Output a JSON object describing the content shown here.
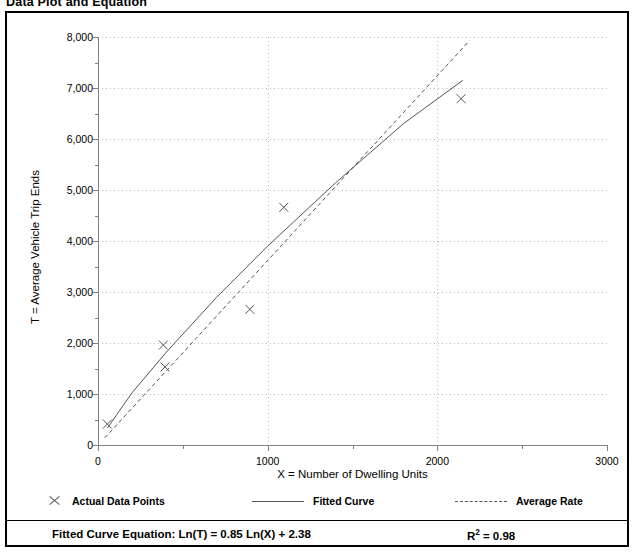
{
  "page": {
    "title": "Data Plot and Equation"
  },
  "legend": {
    "items": [
      {
        "label": "Actual Data Points",
        "marker": "x-marker-icon"
      },
      {
        "label": "Fitted Curve",
        "marker": "solid-line-icon"
      },
      {
        "label": "Average Rate",
        "marker": "dashed-line-icon"
      }
    ]
  },
  "equation": {
    "prefix": "Fitted Curve Equation:",
    "formula": "Ln(T) = 0.85 Ln(X) + 2.38",
    "full": "Fitted Curve Equation:  Ln(T) = 0.85 Ln(X) + 2.38",
    "r_squared_label": "R",
    "r_squared_exp": "2",
    "r_squared_value": "= 0.98",
    "r_squared_full": "R2 = 0.98"
  },
  "chart_data": {
    "type": "scatter",
    "title": "Data Plot and Equation",
    "xlabel": "X = Number of Dwelling Units",
    "ylabel": "T = Average Vehicle Trip Ends",
    "xlim": [
      0,
      3000
    ],
    "ylim": [
      0,
      8000
    ],
    "grid": true,
    "legend_position": "below-plot",
    "x_ticks_major": [
      0,
      1000,
      2000,
      3000
    ],
    "x_tick_labels": [
      "0",
      "1000",
      "2000",
      "3000"
    ],
    "x_ticks_minor": [
      500,
      1500,
      2500
    ],
    "y_ticks_major": [
      0,
      1000,
      2000,
      3000,
      4000,
      5000,
      6000,
      7000,
      8000
    ],
    "y_tick_labels": [
      "0",
      "1,000",
      "2,000",
      "3,000",
      "4,000",
      "5,000",
      "6,000",
      "7,000",
      "8,000"
    ],
    "y_ticks_minor": [
      500,
      1500,
      2500,
      3500,
      4500,
      5500,
      6500,
      7500
    ],
    "series": [
      {
        "name": "Actual Data Points",
        "type": "scatter",
        "marker": "x",
        "color": "#555555",
        "points": [
          {
            "x": 55,
            "y": 410
          },
          {
            "x": 385,
            "y": 1960
          },
          {
            "x": 395,
            "y": 1530
          },
          {
            "x": 895,
            "y": 2660
          },
          {
            "x": 1095,
            "y": 4660
          },
          {
            "x": 2140,
            "y": 6790
          }
        ]
      },
      {
        "name": "Fitted Curve",
        "type": "line",
        "style": "solid",
        "color": "#555555",
        "equation": "Ln(T) = 0.85 Ln(X) + 2.38",
        "points": [
          {
            "x": 55,
            "y": 330
          },
          {
            "x": 200,
            "y": 1020
          },
          {
            "x": 400,
            "y": 1810
          },
          {
            "x": 700,
            "y": 2900
          },
          {
            "x": 1000,
            "y": 3900
          },
          {
            "x": 1400,
            "y": 5140
          },
          {
            "x": 1800,
            "y": 6300
          },
          {
            "x": 2150,
            "y": 7150
          }
        ]
      },
      {
        "name": "Average Rate",
        "type": "line",
        "style": "dashed",
        "color": "#555555",
        "points": [
          {
            "x": 40,
            "y": 140
          },
          {
            "x": 2190,
            "y": 7930
          }
        ]
      }
    ],
    "r_squared": 0.98
  }
}
